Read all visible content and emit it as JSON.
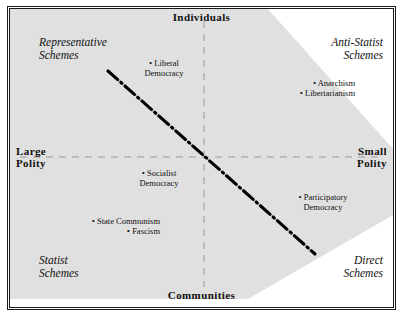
{
  "diagram": {
    "colors": {
      "band_fill": "#e0e0e0",
      "frame_stroke": "#1a1a1a",
      "guide_stroke": "#999999",
      "diagonal_stroke": "#000000",
      "text": "#111111",
      "background": "#ffffff"
    },
    "axes": {
      "top_label": "Individuals",
      "bottom_label": "Communities",
      "left_label": "Large\nPolity",
      "right_label": "Small\nPolity",
      "vertical_axis_name": "Individuals – Communities",
      "horizontal_axis_name": "Large Polity – Small Polity",
      "guides": "dashed crosshair through center"
    },
    "quadrants": [
      {
        "key": "top_left",
        "label": "Representative\nSchemes",
        "align": "left"
      },
      {
        "key": "top_right",
        "label": "Anti-Statist\nSchemes",
        "align": "right"
      },
      {
        "key": "bottom_left",
        "label": "Statist\nSchemes",
        "align": "left"
      },
      {
        "key": "bottom_right",
        "label": "Direct\nSchemes",
        "align": "right"
      }
    ],
    "points": [
      {
        "key": "liberal_democracy",
        "bullet": "•",
        "line1": "Liberal",
        "line2": "Democracy",
        "quadrant": "top_left"
      },
      {
        "key": "anarchism",
        "bullet": "•",
        "line1": "Anarchism",
        "line2": "",
        "quadrant": "top_right"
      },
      {
        "key": "libertarianism",
        "bullet": "•",
        "line1": "Libertarianism",
        "line2": "",
        "quadrant": "top_right"
      },
      {
        "key": "socialist_democracy",
        "bullet": "•",
        "line1": "Socialist",
        "line2": "Democracy",
        "quadrant": "bottom_left"
      },
      {
        "key": "state_communism",
        "bullet": "•",
        "line1": "State Communism",
        "line2": "",
        "quadrant": "bottom_left"
      },
      {
        "key": "fascism",
        "bullet": "•",
        "line1": "Fascism",
        "line2": "",
        "quadrant": "bottom_left"
      },
      {
        "key": "participatory_democracy",
        "bullet": "•",
        "line1": "Participatory",
        "line2": "Democracy",
        "quadrant": "bottom_right"
      }
    ],
    "band": {
      "description": "shaded diagonal band running from upper-left to lower-right",
      "fill": "#e0e0e0"
    },
    "trend_line": {
      "description": "dash-dot diagonal trend line from upper-left to lower-right",
      "style": "dash-dot",
      "color": "#000000"
    }
  }
}
